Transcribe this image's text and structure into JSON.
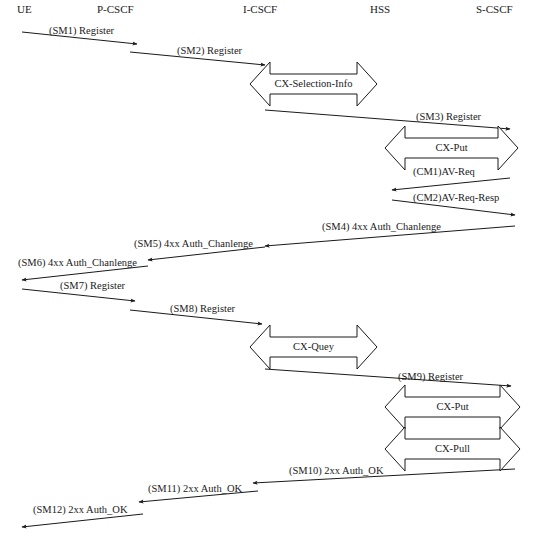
{
  "entities": [
    {
      "id": "ue",
      "label": "UE",
      "x": 17
    },
    {
      "id": "pcscf",
      "label": "P-CSCF",
      "x": 97
    },
    {
      "id": "icscf",
      "label": "I-CSCF",
      "x": 243
    },
    {
      "id": "hss",
      "label": "HSS",
      "x": 370
    },
    {
      "id": "scscf",
      "label": "S-CSCF",
      "x": 476
    }
  ],
  "messages": [
    {
      "id": "sm1",
      "label": "(SM1) Register",
      "x1": 22,
      "y1": 32,
      "x2": 137,
      "y2": 44,
      "lx": 49,
      "ly": 26
    },
    {
      "id": "sm2",
      "label": "(SM2) Register",
      "x1": 130,
      "y1": 52,
      "x2": 265,
      "y2": 65,
      "lx": 177,
      "ly": 46
    },
    {
      "id": "sm3",
      "label": "(SM3) Register",
      "x1": 265,
      "y1": 110,
      "x2": 510,
      "y2": 129,
      "lx": 416,
      "ly": 112
    },
    {
      "id": "cm1",
      "label": "(CM1)AV-Req",
      "x1": 510,
      "y1": 178,
      "x2": 392,
      "y2": 190,
      "lx": 413,
      "ly": 167
    },
    {
      "id": "cm2",
      "label": "(CM2)AV-Req-Resp",
      "x1": 392,
      "y1": 200,
      "x2": 515,
      "y2": 215,
      "lx": 413,
      "ly": 193
    },
    {
      "id": "sm4",
      "label": "(SM4) 4xx Auth_Chanlenge",
      "x1": 515,
      "y1": 226,
      "x2": 265,
      "y2": 246,
      "lx": 322,
      "ly": 222
    },
    {
      "id": "sm5",
      "label": "(SM5) 4xx Auth_Chanlenge",
      "x1": 265,
      "y1": 247,
      "x2": 148,
      "y2": 260,
      "lx": 134,
      "ly": 239
    },
    {
      "id": "sm6",
      "label": "(SM6) 4xx Auth_Chanlenge",
      "x1": 148,
      "y1": 266,
      "x2": 22,
      "y2": 280,
      "lx": 18,
      "ly": 258
    },
    {
      "id": "sm7",
      "label": "(SM7) Register",
      "x1": 22,
      "y1": 289,
      "x2": 135,
      "y2": 301,
      "lx": 60,
      "ly": 281
    },
    {
      "id": "sm8",
      "label": "(SM8) Register",
      "x1": 130,
      "y1": 310,
      "x2": 262,
      "y2": 324,
      "lx": 170,
      "ly": 304
    },
    {
      "id": "sm9",
      "label": "(SM9) Register",
      "x1": 265,
      "y1": 369,
      "x2": 511,
      "y2": 386,
      "lx": 398,
      "ly": 372
    },
    {
      "id": "sm10",
      "label": "(SM10) 2xx Auth_OK",
      "x1": 515,
      "y1": 469,
      "x2": 253,
      "y2": 483,
      "lx": 289,
      "ly": 466
    },
    {
      "id": "sm11",
      "label": "(SM11) 2xx Auth_OK",
      "x1": 258,
      "y1": 491,
      "x2": 139,
      "y2": 502,
      "lx": 148,
      "ly": 484
    },
    {
      "id": "sm12",
      "label": "(SM12) 2xx Auth_OK",
      "x1": 143,
      "y1": 514,
      "x2": 22,
      "y2": 527,
      "lx": 33,
      "ly": 505
    }
  ],
  "double_arrows": [
    {
      "id": "cx-selection-info",
      "label": "CX-Selection-Info",
      "x1": 250,
      "x2": 377,
      "y": 84
    },
    {
      "id": "cx-put-1",
      "label": "CX-Put",
      "x1": 385,
      "x2": 518,
      "y": 148
    },
    {
      "id": "cx-quey",
      "label": "CX-Quey",
      "x1": 250,
      "x2": 377,
      "y": 347
    },
    {
      "id": "cx-put-2",
      "label": "CX-Put",
      "x1": 385,
      "x2": 520,
      "y": 407
    },
    {
      "id": "cx-pull",
      "label": "CX-Pull",
      "x1": 385,
      "x2": 520,
      "y": 449
    }
  ],
  "colors": {
    "line": "#1a1a1a",
    "background": "#ffffff"
  }
}
